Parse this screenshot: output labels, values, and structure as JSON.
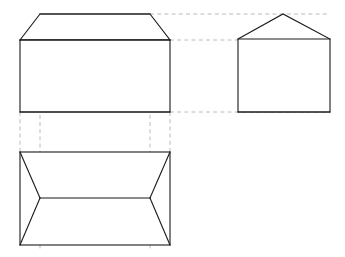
{
  "sheet": {
    "title": "Orthographic Projection of a Hip-Roof Prism",
    "width": 345,
    "height": 257,
    "background_color": "#ffffff",
    "object_line_color": "#1a1a1a",
    "projection_line_color": "#b4b4b4",
    "projection_line_style": "dashed",
    "projection_angle": "third-angle",
    "view_count": 3
  },
  "views": {
    "front": {
      "name": "front-elevation",
      "label": "",
      "description": "Rectangular wall body with trapezoidal hip roof above",
      "body_rect": {
        "x1": 20,
        "y1": 40,
        "x2": 170,
        "y2": 112
      },
      "roof_ridge": {
        "x1": 40,
        "y1": 14,
        "x2": 150,
        "y2": 14
      },
      "roof_outline_points": "20,40 40,14 150,14 170,40",
      "eave_line": {
        "x1": 20,
        "y1": 40,
        "x2": 170,
        "y2": 40
      },
      "base_line": {
        "x1": 20,
        "y1": 112,
        "x2": 170,
        "y2": 112
      }
    },
    "side": {
      "name": "side-elevation",
      "label": "",
      "description": "Pentagon house profile: rectangle with triangular gable",
      "body_rect": {
        "x1": 238,
        "y1": 39,
        "x2": 330,
        "y2": 112
      },
      "gable_apex": {
        "x": 283,
        "y": 14
      },
      "outline_points": "238,39 283,14 330,39 330,112 238,112",
      "eave_line": {
        "x1": 238,
        "y1": 39,
        "x2": 330,
        "y2": 39
      },
      "base_line": {
        "x1": 238,
        "y1": 112,
        "x2": 330,
        "y2": 112
      }
    },
    "top": {
      "name": "top-plan",
      "label": "",
      "description": "Rectangular plan with central ridge and four hip diagonals",
      "body_rect": {
        "x1": 20,
        "y1": 152,
        "x2": 170,
        "y2": 245
      },
      "ridge_line": {
        "x1": 40,
        "y1": 198,
        "x2": 150,
        "y2": 198
      },
      "hip_lines": [
        {
          "name": "hip-top-left",
          "x1": 20,
          "y1": 152,
          "x2": 40,
          "y2": 198
        },
        {
          "name": "hip-top-right",
          "x1": 170,
          "y1": 152,
          "x2": 150,
          "y2": 198
        },
        {
          "name": "hip-bottom-left",
          "x1": 20,
          "y1": 245,
          "x2": 40,
          "y2": 198
        },
        {
          "name": "hip-bottom-right",
          "x1": 170,
          "y1": 245,
          "x2": 150,
          "y2": 198
        }
      ]
    }
  },
  "projection_lines": {
    "horizontal": [
      {
        "name": "ridge-alignment-front-to-side",
        "x1": 150,
        "y1": 14,
        "x2": 330,
        "y2": 14
      },
      {
        "name": "eave-alignment-front-to-side",
        "x1": 170,
        "y1": 40,
        "x2": 330,
        "y2": 40
      },
      {
        "name": "base-alignment-front-to-side",
        "x1": 170,
        "y1": 112,
        "x2": 330,
        "y2": 112
      }
    ],
    "vertical": [
      {
        "name": "ridge-left-alignment-front-to-top",
        "x1": 40,
        "y1": 14,
        "x2": 40,
        "y2": 250
      },
      {
        "name": "ridge-right-alignment-front-to-top",
        "x1": 150,
        "y1": 14,
        "x2": 150,
        "y2": 250
      },
      {
        "name": "left-edge-alignment-front-to-top",
        "x1": 20,
        "y1": 112,
        "x2": 20,
        "y2": 152
      },
      {
        "name": "right-edge-alignment-front-to-top",
        "x1": 170,
        "y1": 112,
        "x2": 170,
        "y2": 152
      }
    ]
  }
}
